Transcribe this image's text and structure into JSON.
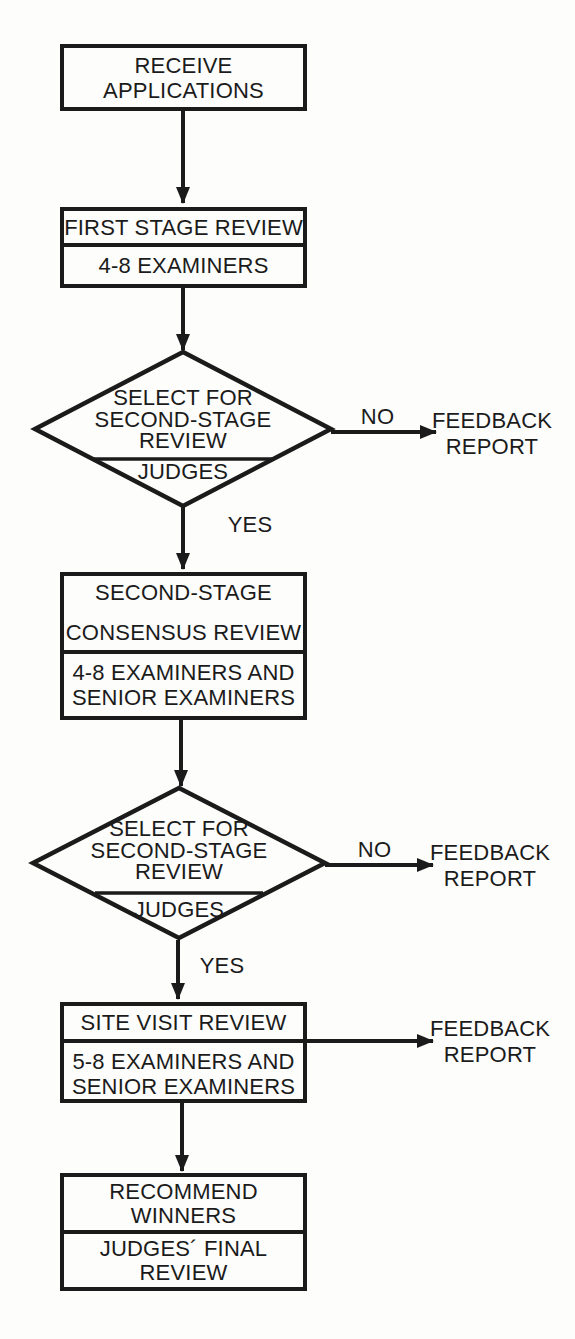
{
  "figure": {
    "ink": "#1b1b1b",
    "paper": "#fdfdfc"
  },
  "nodes": {
    "receive": {
      "line1": "RECEIVE",
      "line2": "APPLICATIONS"
    },
    "first_stage": {
      "title": "FIRST STAGE REVIEW",
      "staff": "4-8 EXAMINERS"
    },
    "decision1": {
      "line1": "SELECT FOR",
      "line2": "SECOND-STAGE",
      "line3": "REVIEW",
      "owner": "JUDGES"
    },
    "consensus": {
      "title_line1": "SECOND-STAGE",
      "title_line2": "CONSENSUS REVIEW",
      "staff_line1": "4-8 EXAMINERS AND",
      "staff_line2": "SENIOR EXAMINERS"
    },
    "decision2": {
      "line1": "SELECT FOR",
      "line2": "SECOND-STAGE",
      "line3": "REVIEW",
      "owner": "JUDGES"
    },
    "site_visit": {
      "title": "SITE VISIT REVIEW",
      "staff_line1": "5-8 EXAMINERS AND",
      "staff_line2": "SENIOR EXAMINERS"
    },
    "recommend": {
      "title_line1": "RECOMMEND",
      "title_line2": "WINNERS",
      "staff_line1": "JUDGES´ FINAL",
      "staff_line2": "REVIEW"
    }
  },
  "edge_labels": {
    "no": "NO",
    "yes": "YES"
  },
  "feedback_report": {
    "line1": "FEEDBACK",
    "line2": "REPORT"
  }
}
